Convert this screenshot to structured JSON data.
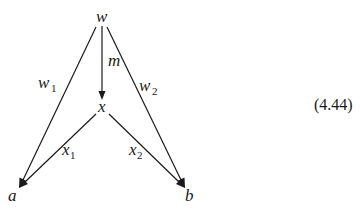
{
  "diagram": {
    "nodes": [
      {
        "id": "w",
        "label": "w",
        "x": 101,
        "y": 21
      },
      {
        "id": "x",
        "label": "x",
        "x": 102,
        "y": 111
      },
      {
        "id": "a",
        "label": "a",
        "x": 13,
        "y": 200
      },
      {
        "id": "b",
        "label": "b",
        "x": 189,
        "y": 200
      }
    ],
    "edges": [
      {
        "from": "w",
        "to": "x",
        "label": "m",
        "label_sub": ""
      },
      {
        "from": "w",
        "to": "a",
        "label": "w",
        "label_sub": "1"
      },
      {
        "from": "w",
        "to": "b",
        "label": "w",
        "label_sub": "2"
      },
      {
        "from": "x",
        "to": "a",
        "label": "x",
        "label_sub": "1"
      },
      {
        "from": "x",
        "to": "b",
        "label": "x",
        "label_sub": "2"
      }
    ],
    "equation_number": "(4.44)",
    "colors": {
      "stroke": "#1a1a1a",
      "background": "#ffffff"
    }
  }
}
